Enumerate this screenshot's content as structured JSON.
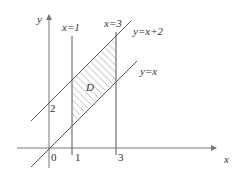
{
  "diagram": {
    "type": "region-plot",
    "axes": {
      "x_label": "x",
      "y_label": "y",
      "origin_label": "0"
    },
    "ticks": {
      "x": [
        "1",
        "3"
      ],
      "y": [
        "2"
      ]
    },
    "lines": [
      {
        "label": "x=1",
        "kind": "vertical",
        "x": 1
      },
      {
        "label": "x=3",
        "kind": "vertical",
        "x": 3
      },
      {
        "label": "y=x+2",
        "kind": "slope",
        "slope": 1,
        "intercept": 2
      },
      {
        "label": "y=x",
        "kind": "slope",
        "slope": 1,
        "intercept": 0
      }
    ],
    "region": {
      "label": "D",
      "description": "1 ≤ x ≤ 3, x ≤ y ≤ x+2",
      "fill": "hatched"
    },
    "colors": {
      "line": "#555555",
      "axis": "#777777",
      "hatch": "#888888"
    }
  }
}
